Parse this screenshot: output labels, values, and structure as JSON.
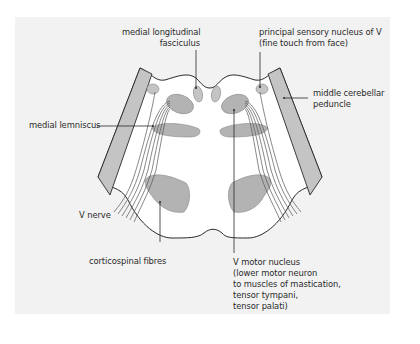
{
  "diagram": {
    "colors": {
      "background": "#f2f2f2",
      "section_fill": "#ffffff",
      "structure_fill": "#b3b3b3",
      "peduncle_fill": "#c4c4c4",
      "outline": "#2a2a2a"
    },
    "labels": {
      "mlf": [
        "medial longitudinal",
        "fasciculus"
      ],
      "principal_sensory": [
        "principal sensory nucleus of V",
        "(fine touch from face)"
      ],
      "middle_cerebellar": [
        "middle cerebellar",
        "peduncle"
      ],
      "medial_lemniscus": [
        "medial lemniscus"
      ],
      "v_nerve": [
        "V nerve"
      ],
      "corticospinal": [
        "corticospinal fibres"
      ],
      "v_motor": [
        "V motor nucleus",
        "(lower motor neuron",
        "to muscles of mastication,",
        "tensor tympani,",
        "tensor palati)"
      ]
    }
  }
}
